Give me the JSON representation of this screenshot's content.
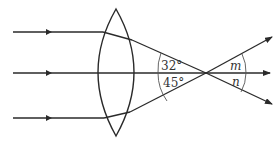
{
  "diagram": {
    "title": "",
    "colors": {
      "line": "#2a2a2a",
      "text": "#333333",
      "background": "#ffffff"
    },
    "lens": {
      "type": "convex-lens"
    },
    "rays": [
      {
        "name": "incident-ray-top"
      },
      {
        "name": "incident-ray-middle"
      },
      {
        "name": "incident-ray-bottom"
      }
    ],
    "angles": {
      "upper_left": "32°",
      "lower_left": "45°",
      "upper_right": "m",
      "lower_right": "n"
    }
  }
}
